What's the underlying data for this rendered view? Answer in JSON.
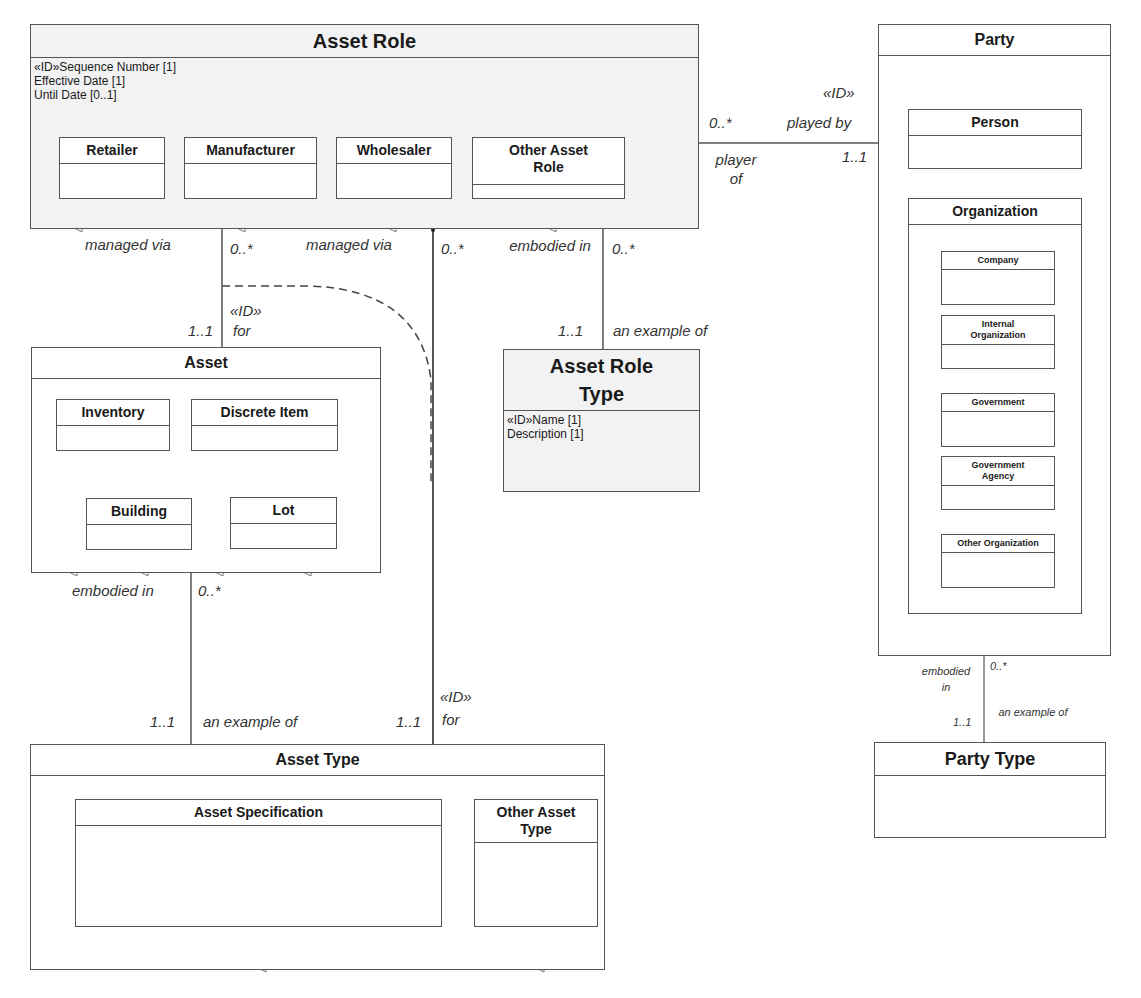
{
  "asset_role": {
    "title": "Asset Role",
    "attributes": [
      "«ID»Sequence Number [1]",
      "Effective Date [1]",
      "Until Date [0..1]"
    ],
    "subtypes": [
      "Retailer",
      "Manufacturer",
      "Wholesaler",
      "Other  Asset Role"
    ]
  },
  "party": {
    "title": "Party",
    "person": "Person",
    "organization": {
      "title": "Organization",
      "subtypes": [
        "Company",
        "Internal Organization",
        "Government",
        "Government Agency",
        "Other Organization"
      ]
    }
  },
  "asset": {
    "title": "Asset",
    "subtypes": [
      "Inventory",
      "Discrete Item",
      "Building",
      "Lot"
    ]
  },
  "asset_role_type": {
    "title": "Asset Role Type",
    "attributes": [
      "«ID»Name [1]",
      "Description [1]"
    ]
  },
  "asset_type": {
    "title": "Asset Type",
    "subtypes": [
      "Asset Specification",
      "Other Asset Type"
    ]
  },
  "party_type": {
    "title": "Party Type"
  },
  "relationships": {
    "role_party": {
      "source_mult": "0..*",
      "source_role": "player of",
      "target_stereotype": "«ID»",
      "target_role": "played by",
      "target_mult": "1..1"
    },
    "role_asset": {
      "source_role": "managed via",
      "source_mult": "0..*",
      "target_mult": "1..1",
      "target_stereotype": "«ID»",
      "target_role": "for"
    },
    "role_assettype": {
      "source_role": "managed via",
      "source_mult": "0..*",
      "target_mult": "1..1",
      "target_stereotype": "«ID»",
      "target_role": "for"
    },
    "role_roletype": {
      "source_role": "embodied in",
      "source_mult": "0..*",
      "target_mult": "1..1",
      "target_role": "an example of"
    },
    "asset_assettype": {
      "source_role": "embodied in",
      "source_mult": "0..*",
      "target_mult": "1..1",
      "target_role": "an example of"
    },
    "party_partytype": {
      "source_role": "embodied in",
      "source_mult": "0..*",
      "target_mult": "1..1",
      "target_role": "an example of"
    }
  }
}
